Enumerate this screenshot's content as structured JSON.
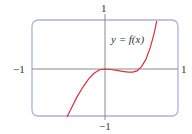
{
  "chart_data": {
    "type": "line",
    "title": "",
    "xlabel": "",
    "ylabel": "",
    "xlim": [
      -1,
      1
    ],
    "ylim": [
      -1,
      1
    ],
    "grid": false,
    "tick_labels": {
      "x_left": "−1",
      "x_right": "1",
      "y_top": "1",
      "y_bottom": "−1"
    },
    "annotations": [
      {
        "text": "y = f(x)",
        "x": 0.28,
        "y": 0.62
      }
    ],
    "series": [
      {
        "name": "y = f(x)",
        "color": "#d9303a",
        "x": [
          -0.52,
          -0.45,
          -0.38,
          -0.3,
          -0.22,
          -0.15,
          -0.08,
          0.0,
          0.08,
          0.16,
          0.24,
          0.32,
          0.38,
          0.44,
          0.5,
          0.56,
          0.62,
          0.67,
          0.71
        ],
        "y": [
          -1.0,
          -0.78,
          -0.57,
          -0.37,
          -0.2,
          -0.09,
          -0.02,
          0.0,
          -0.01,
          -0.03,
          -0.05,
          -0.065,
          -0.065,
          -0.04,
          0.05,
          0.2,
          0.45,
          0.72,
          1.0
        ]
      }
    ]
  },
  "colors": {
    "frame": "#a9b3e0",
    "axes": "#8a8a8a",
    "curve": "#d9303a",
    "text": "#333333"
  }
}
